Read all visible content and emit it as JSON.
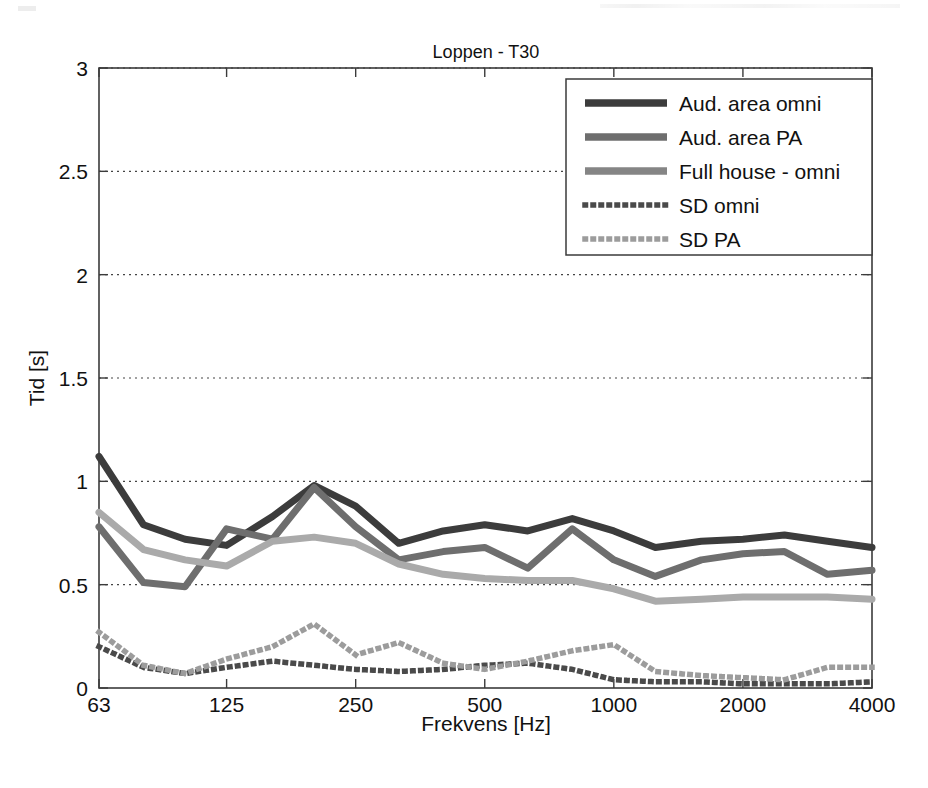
{
  "chart_data": {
    "type": "line",
    "title": "Loppen - T30",
    "xlabel": "Frekvens [Hz]",
    "ylabel": "Tid [s]",
    "xscale": "log",
    "xlim": [
      63,
      4000
    ],
    "ylim": [
      0,
      3
    ],
    "xticks": [
      63,
      125,
      250,
      500,
      1000,
      2000,
      4000
    ],
    "xtick_labels": [
      "63",
      "125",
      "250",
      "500",
      "1000",
      "2000",
      "4000"
    ],
    "yticks": [
      0,
      0.5,
      1,
      1.5,
      2,
      2.5,
      3
    ],
    "ytick_labels": [
      "0",
      "0.5",
      "1",
      "1.5",
      "2",
      "2.5",
      "3"
    ],
    "grid": "horizontal-dotted",
    "legend_position": "top-right",
    "x": [
      63,
      80,
      100,
      125,
      160,
      200,
      250,
      315,
      400,
      500,
      630,
      800,
      1000,
      1250,
      1600,
      2000,
      2500,
      3150,
      4000
    ],
    "series": [
      {
        "name": "Aud. area omni",
        "style": "solid",
        "color": "#3c3c3c",
        "values": [
          1.12,
          0.79,
          0.72,
          0.69,
          0.83,
          0.98,
          0.88,
          0.7,
          0.76,
          0.79,
          0.76,
          0.82,
          0.76,
          0.68,
          0.71,
          0.72,
          0.74,
          0.71,
          0.68
        ]
      },
      {
        "name": "Aud. area PA",
        "style": "solid",
        "color": "#6e6e6e",
        "values": [
          0.78,
          0.51,
          0.49,
          0.77,
          0.72,
          0.97,
          0.78,
          0.62,
          0.66,
          0.68,
          0.58,
          0.77,
          0.62,
          0.54,
          0.62,
          0.65,
          0.66,
          0.55,
          0.57
        ]
      },
      {
        "name": "Full house - omni",
        "style": "solid",
        "color": "#aaaaaa",
        "values": [
          0.85,
          0.67,
          0.62,
          0.59,
          0.71,
          0.73,
          0.7,
          0.6,
          0.55,
          0.53,
          0.52,
          0.52,
          0.48,
          0.42,
          0.43,
          0.44,
          0.44,
          0.44,
          0.43
        ]
      },
      {
        "name": "SD omni",
        "style": "dotted",
        "color": "#4a4a4a",
        "values": [
          0.2,
          0.1,
          0.07,
          0.1,
          0.13,
          0.11,
          0.09,
          0.08,
          0.09,
          0.11,
          0.12,
          0.09,
          0.04,
          0.03,
          0.03,
          0.02,
          0.02,
          0.02,
          0.03
        ]
      },
      {
        "name": "SD PA",
        "style": "dotted",
        "color": "#9c9c9c",
        "values": [
          0.27,
          0.11,
          0.07,
          0.14,
          0.2,
          0.31,
          0.16,
          0.22,
          0.12,
          0.09,
          0.13,
          0.18,
          0.21,
          0.08,
          0.06,
          0.05,
          0.04,
          0.1,
          0.1
        ]
      }
    ]
  },
  "legend": {
    "items": [
      {
        "label": "Aud. area omni",
        "color": "#3c3c3c",
        "style": "solid"
      },
      {
        "label": "Aud. area PA",
        "color": "#6e6e6e",
        "style": "solid"
      },
      {
        "label": "Full house - omni",
        "color": "#858585",
        "style": "solid"
      },
      {
        "label": "SD omni",
        "color": "#4a4a4a",
        "style": "dotted"
      },
      {
        "label": "SD PA",
        "color": "#9c9c9c",
        "style": "dotted"
      }
    ]
  }
}
